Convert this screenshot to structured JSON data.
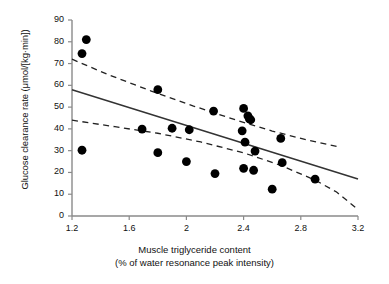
{
  "chart_data": {
    "type": "scatter",
    "title": "",
    "xlabel": "Muscle triglyceride content (% of water resonance peak intensity)",
    "xlabel_line1": "Muscle triglyceride content",
    "xlabel_line2": "(% of water resonance peak intensity)",
    "ylabel": "Glucose clearance rate (μmol/[kg·min])",
    "xlim": [
      1.2,
      3.2
    ],
    "ylim": [
      0,
      90
    ],
    "xticks": [
      1.2,
      1.6,
      2,
      2.4,
      2.8,
      3.2
    ],
    "xticklabels": [
      "1.2",
      "1.6",
      "2",
      "2.4",
      "2.8",
      "3.2"
    ],
    "yticks": [
      0,
      10,
      20,
      30,
      40,
      50,
      60,
      70,
      80,
      90
    ],
    "yticklabels": [
      "0",
      "10",
      "20",
      "30",
      "40",
      "50",
      "60",
      "70",
      "80",
      "90"
    ],
    "grid": false,
    "legend": false,
    "marker_color": "#000000",
    "marker_size": 4.4,
    "line_color": "#333333",
    "band_color": "#222222",
    "points": [
      {
        "x": 1.27,
        "y": 74.6
      },
      {
        "x": 1.3,
        "y": 81.0
      },
      {
        "x": 1.27,
        "y": 30.2
      },
      {
        "x": 1.69,
        "y": 39.9
      },
      {
        "x": 1.8,
        "y": 58.0
      },
      {
        "x": 1.8,
        "y": 29.1
      },
      {
        "x": 1.9,
        "y": 40.3
      },
      {
        "x": 2.0,
        "y": 25.0
      },
      {
        "x": 2.02,
        "y": 39.6
      },
      {
        "x": 2.19,
        "y": 48.2
      },
      {
        "x": 2.2,
        "y": 19.5
      },
      {
        "x": 2.39,
        "y": 39.1
      },
      {
        "x": 2.4,
        "y": 49.4
      },
      {
        "x": 2.41,
        "y": 33.9
      },
      {
        "x": 2.4,
        "y": 21.9
      },
      {
        "x": 2.43,
        "y": 46.0
      },
      {
        "x": 2.44,
        "y": 44.6
      },
      {
        "x": 2.45,
        "y": 44.2
      },
      {
        "x": 2.47,
        "y": 21.0
      },
      {
        "x": 2.48,
        "y": 29.8
      },
      {
        "x": 2.6,
        "y": 12.3
      },
      {
        "x": 2.66,
        "y": 35.6
      },
      {
        "x": 2.67,
        "y": 24.5
      },
      {
        "x": 2.9,
        "y": 16.9
      }
    ],
    "regression_line": {
      "label": "regression line",
      "style": "solid",
      "x_start": 1.2,
      "y_start": 58.0,
      "x_end": 3.2,
      "y_end": 17.0
    },
    "confidence_band_upper": {
      "label": "upper 95% confidence limit",
      "style": "dashed",
      "x_start": 1.2,
      "y_start": 72.0,
      "x_end": 3.05,
      "y_end": 32.0,
      "points": [
        {
          "x": 1.2,
          "y": 72.0
        },
        {
          "x": 1.45,
          "y": 65.0
        },
        {
          "x": 1.75,
          "y": 57.5
        },
        {
          "x": 2.05,
          "y": 50.5
        },
        {
          "x": 2.35,
          "y": 44.0
        },
        {
          "x": 2.6,
          "y": 39.0
        },
        {
          "x": 2.85,
          "y": 34.8
        },
        {
          "x": 3.05,
          "y": 32.0
        }
      ]
    },
    "confidence_band_lower": {
      "label": "lower 95% confidence limit",
      "style": "dashed",
      "x_start": 1.2,
      "y_start": 44.0,
      "x_end": 3.2,
      "y_end": 3.0,
      "points": [
        {
          "x": 1.2,
          "y": 44.0
        },
        {
          "x": 1.5,
          "y": 41.0
        },
        {
          "x": 1.8,
          "y": 38.0
        },
        {
          "x": 2.1,
          "y": 34.0
        },
        {
          "x": 2.4,
          "y": 29.0
        },
        {
          "x": 2.65,
          "y": 23.5
        },
        {
          "x": 2.9,
          "y": 16.5
        },
        {
          "x": 3.05,
          "y": 11.0
        },
        {
          "x": 3.2,
          "y": 3.0
        }
      ]
    }
  }
}
